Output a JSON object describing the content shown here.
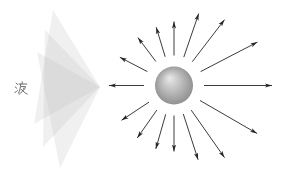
{
  "diagram": {
    "label": "波",
    "label_color": "#666666",
    "label_pos": [
      14,
      81
    ],
    "background": "#ffffff",
    "wave_fan": {
      "apex": [
        100,
        87
      ],
      "hatch_color": "#bcbcbc",
      "sheet_opacity": 0.5,
      "sheets": [
        {
          "points": [
            [
              100,
              87
            ],
            [
              53,
              10
            ],
            [
              34,
              124
            ]
          ]
        },
        {
          "points": [
            [
              100,
              87
            ],
            [
              45,
              30
            ],
            [
              43,
              147
            ]
          ]
        },
        {
          "points": [
            [
              100,
              87
            ],
            [
              37,
              52
            ],
            [
              60,
              168
            ]
          ]
        }
      ]
    },
    "sphere": {
      "cx": 174,
      "cy": 85.5,
      "r": 19,
      "highlight_color": "#ededed",
      "mid_color": "#bdbdbd",
      "edge_color": "#838383",
      "texture_opacity": 0.14
    },
    "arrows": {
      "color": "#262626",
      "start_radius": 30,
      "items": [
        {
          "angle_deg": 0,
          "length": 98
        },
        {
          "angle_deg": 27.5,
          "length": 94
        },
        {
          "angle_deg": 52.5,
          "length": 83
        },
        {
          "angle_deg": 71,
          "length": 76
        },
        {
          "angle_deg": 90,
          "length": 64
        },
        {
          "angle_deg": 107,
          "length": 61
        },
        {
          "angle_deg": 127,
          "length": 60
        },
        {
          "angle_deg": 152.5,
          "length": 61
        },
        {
          "angle_deg": 180,
          "length": 65
        },
        {
          "angle_deg": 213.5,
          "length": 63
        },
        {
          "angle_deg": 235,
          "length": 64
        },
        {
          "angle_deg": 254,
          "length": 66
        },
        {
          "angle_deg": 270,
          "length": 66
        },
        {
          "angle_deg": 288,
          "length": 78
        },
        {
          "angle_deg": 305,
          "length": 88
        },
        {
          "angle_deg": 330,
          "length": 96
        }
      ]
    }
  }
}
